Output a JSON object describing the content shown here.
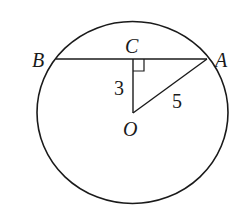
{
  "diagram": {
    "type": "geometry",
    "points": {
      "B": {
        "label": "B"
      },
      "C": {
        "label": "C"
      },
      "A": {
        "label": "A"
      },
      "O": {
        "label": "O"
      }
    },
    "segments": [
      {
        "from": "B",
        "to": "A",
        "label": ""
      },
      {
        "from": "O",
        "to": "C",
        "label": "3"
      },
      {
        "from": "O",
        "to": "A",
        "label": "5"
      }
    ],
    "right_angle_at": "C",
    "stroke_color": "#1a1a1a",
    "background": "#ffffff"
  }
}
